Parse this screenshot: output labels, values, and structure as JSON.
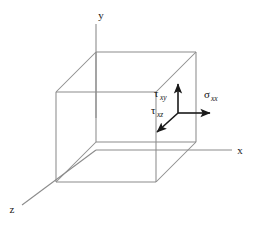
{
  "figure": {
    "background_color": "#ffffff",
    "cube_edge_color": "#8c8c8c",
    "axis_color": "#8c8c8c",
    "arrow_color": "#1a1a1a",
    "width": 258,
    "height": 230
  },
  "axes": [
    {
      "id": "y-axis",
      "label": "y",
      "direction": "vertical-up",
      "label_x": 101,
      "label_y": 19,
      "line": {
        "x1": 96,
        "y1": 24,
        "x2": 96,
        "y2": 118
      }
    },
    {
      "id": "x-axis",
      "label": "x",
      "direction": "horizontal-right",
      "label_x": 240,
      "label_y": 154,
      "line": {
        "x1": 96,
        "y1": 150,
        "x2": 232,
        "y2": 150
      }
    },
    {
      "id": "z-axis",
      "label": "z",
      "direction": "diagonal-down-left",
      "label_x": 12,
      "label_y": 213,
      "line": {
        "x1": 96,
        "y1": 150,
        "x2": 22,
        "y2": 205
      }
    }
  ],
  "cube": {
    "front_face": {
      "left": 56,
      "top": 92,
      "right": 156,
      "bottom": 182
    },
    "depth_offset": {
      "dx": 40,
      "dy": -40
    },
    "back_face": {
      "left": 96,
      "top": 52,
      "right": 196,
      "bottom": 142
    }
  },
  "stress_components": [
    {
      "id": "sigma-xx",
      "symbol": "σ",
      "subscript": "xx",
      "full_label": "σxx",
      "type": "normal-stress",
      "direction": "positive-x",
      "arrow": {
        "x1": 178,
        "y1": 113,
        "x2": 212,
        "y2": 113
      },
      "label_x": 208,
      "label_y": 97
    },
    {
      "id": "tau-xy",
      "symbol": "τ",
      "subscript": "xy",
      "full_label": "τxy",
      "type": "shear-stress",
      "direction": "positive-y",
      "arrow": {
        "x1": 178,
        "y1": 113,
        "x2": 178,
        "y2": 82
      },
      "label_x": 155,
      "label_y": 96
    },
    {
      "id": "tau-xz",
      "symbol": "τ",
      "subscript": "xz",
      "full_label": "τxz",
      "type": "shear-stress",
      "direction": "positive-z",
      "arrow": {
        "x1": 178,
        "y1": 113,
        "x2": 155,
        "y2": 134
      },
      "label_x": 152,
      "label_y": 113
    }
  ]
}
